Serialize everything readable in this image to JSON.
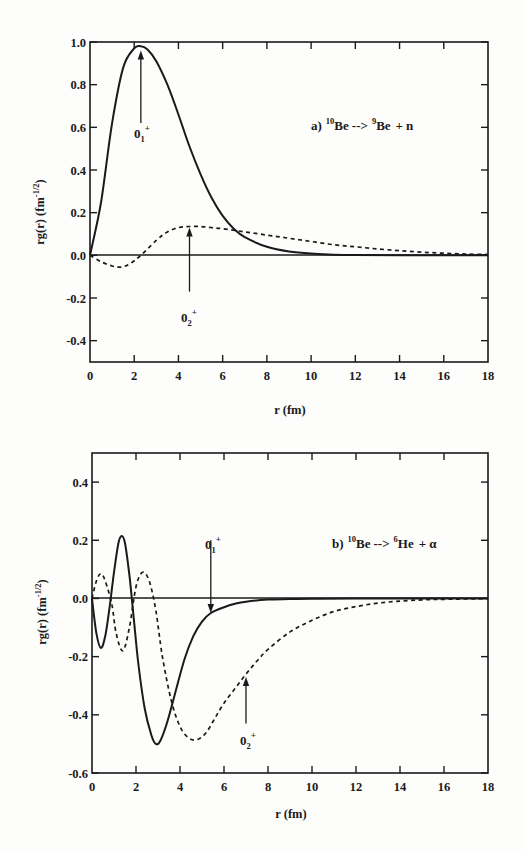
{
  "page": {
    "background": "#fdfdfc",
    "ink": "#1a1a1a"
  },
  "chart_data": [
    {
      "type": "line",
      "panel": "a",
      "title": "a) 10Be --> 9Be + n",
      "annotation": {
        "prefix": "a)",
        "parent_mass": "10",
        "parent": "Be",
        "arrow": "-->",
        "daughter_mass": "9",
        "daughter": "Be",
        "plus": "+",
        "ejectile": "n"
      },
      "xlabel": "r (fm)",
      "ylabel": "rg(r)  (fm",
      "ylabel_exp": "-1/2",
      "ylabel_close": ")",
      "xlim": [
        0,
        18
      ],
      "ylim": [
        -0.5,
        1.0
      ],
      "x_ticks": [
        "0",
        "2",
        "4",
        "6",
        "8",
        "10",
        "12",
        "14",
        "16",
        "18"
      ],
      "y_ticks": [
        "1.0",
        "0.8",
        "0.6",
        "0.4",
        "0.2",
        "0.0",
        "-0.2",
        "-0.4"
      ],
      "grid": false,
      "zero_line": true,
      "series": [
        {
          "name": "0_1+",
          "label_main": "0",
          "label_sub": "1",
          "label_sup": "+",
          "style": "solid",
          "x": [
            0,
            0.5,
            1.0,
            1.5,
            2.0,
            2.3,
            2.6,
            3.0,
            3.5,
            4.0,
            4.5,
            5.0,
            5.5,
            6.0,
            6.5,
            7.0,
            8.0,
            9.0,
            10.0,
            11.0,
            12.0,
            14.0,
            18.0
          ],
          "y": [
            0.0,
            0.25,
            0.62,
            0.88,
            0.97,
            0.98,
            0.965,
            0.91,
            0.8,
            0.66,
            0.51,
            0.38,
            0.27,
            0.185,
            0.125,
            0.085,
            0.04,
            0.018,
            0.008,
            0.003,
            0.001,
            0.0,
            0.0
          ],
          "arrow_at": {
            "x": 2.3,
            "y_from": 0.62,
            "y_to": 0.96
          }
        },
        {
          "name": "0_2+",
          "label_main": "0",
          "label_sub": "2",
          "label_sup": "+",
          "style": "dashed",
          "x": [
            0,
            0.5,
            1.0,
            1.4,
            1.8,
            2.3,
            3.0,
            3.5,
            4.0,
            4.5,
            5.0,
            5.5,
            6.0,
            7.0,
            8.0,
            9.0,
            10.0,
            11.0,
            12.0,
            13.0,
            14.0,
            15.0,
            16.0,
            17.0,
            18.0
          ],
          "y": [
            0.0,
            -0.03,
            -0.05,
            -0.055,
            -0.04,
            0.0,
            0.07,
            0.11,
            0.13,
            0.135,
            0.135,
            0.13,
            0.125,
            0.11,
            0.095,
            0.08,
            0.065,
            0.05,
            0.04,
            0.03,
            0.022,
            0.015,
            0.01,
            0.006,
            0.004
          ],
          "arrow_at": {
            "x": 4.5,
            "y_from": -0.17,
            "y_to": 0.13
          }
        }
      ]
    },
    {
      "type": "line",
      "panel": "b",
      "title": "b) 10Be --> 6He + α",
      "annotation": {
        "prefix": "b)",
        "parent_mass": "10",
        "parent": "Be",
        "arrow": "-->",
        "daughter_mass": "6",
        "daughter": "He",
        "plus": "+",
        "ejectile": "α"
      },
      "xlabel": "r (fm)",
      "ylabel": "rg(r)  (fm",
      "ylabel_exp": "-1/2",
      "ylabel_close": ")",
      "xlim": [
        0,
        18
      ],
      "ylim": [
        -0.6,
        0.5
      ],
      "x_ticks": [
        "0",
        "2",
        "4",
        "6",
        "8",
        "10",
        "12",
        "14",
        "16",
        "18"
      ],
      "y_ticks": [
        "0.4",
        "0.2",
        "0.0",
        "-0.2",
        "-0.4",
        "-0.6"
      ],
      "grid": false,
      "zero_line": true,
      "series": [
        {
          "name": "0_1+",
          "label_main": "0",
          "label_sub": "1",
          "label_sup": "+",
          "style": "solid",
          "x": [
            0,
            0.2,
            0.4,
            0.6,
            0.8,
            1.0,
            1.2,
            1.35,
            1.5,
            1.7,
            1.9,
            2.1,
            2.4,
            2.7,
            2.9,
            3.1,
            3.4,
            3.8,
            4.2,
            4.6,
            5.0,
            5.4,
            6.0,
            6.5,
            7.0,
            8.0,
            9.0,
            10.0,
            12.0,
            18.0
          ],
          "y": [
            0.0,
            -0.12,
            -0.17,
            -0.13,
            -0.03,
            0.09,
            0.19,
            0.215,
            0.19,
            0.08,
            -0.07,
            -0.22,
            -0.38,
            -0.47,
            -0.5,
            -0.49,
            -0.43,
            -0.32,
            -0.21,
            -0.13,
            -0.08,
            -0.05,
            -0.03,
            -0.018,
            -0.011,
            -0.004,
            -0.002,
            -0.001,
            0.0,
            0.0
          ],
          "arrow_at": {
            "x": 5.4,
            "y_from": 0.2,
            "y_to": -0.05
          }
        },
        {
          "name": "0_2+",
          "label_main": "0",
          "label_sub": "2",
          "label_sup": "+",
          "style": "dashed",
          "x": [
            0,
            0.2,
            0.4,
            0.6,
            0.9,
            1.1,
            1.4,
            1.7,
            2.0,
            2.3,
            2.6,
            2.9,
            3.2,
            3.6,
            4.0,
            4.4,
            4.8,
            5.2,
            5.6,
            6.0,
            6.5,
            7.0,
            7.5,
            8.0,
            9.0,
            10.0,
            11.0,
            12.0,
            13.0,
            14.0,
            15.0,
            16.0,
            18.0
          ],
          "y": [
            0.0,
            0.06,
            0.085,
            0.06,
            -0.02,
            -0.12,
            -0.18,
            -0.1,
            0.04,
            0.09,
            0.06,
            -0.04,
            -0.2,
            -0.35,
            -0.44,
            -0.48,
            -0.485,
            -0.46,
            -0.41,
            -0.36,
            -0.31,
            -0.26,
            -0.215,
            -0.175,
            -0.115,
            -0.075,
            -0.045,
            -0.028,
            -0.016,
            -0.009,
            -0.005,
            -0.003,
            -0.001
          ],
          "arrow_at": {
            "x": 7.0,
            "y_from": -0.43,
            "y_to": -0.27
          }
        }
      ]
    }
  ]
}
